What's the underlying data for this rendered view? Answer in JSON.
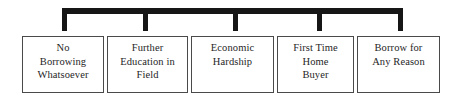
{
  "diagram": {
    "type": "bracket-hierarchy",
    "orientation": "horizontal",
    "connector": {
      "name": "top-bracket",
      "color": "#161616",
      "stem_count": 5
    },
    "options": [
      {
        "id": "no-borrowing",
        "label": "No\nBorrowing\nWhatsoever"
      },
      {
        "id": "further-education",
        "label": "Further\nEducation in\nField"
      },
      {
        "id": "economic-hardship",
        "label": "Economic\nHardship"
      },
      {
        "id": "first-time-buyer",
        "label": "First Time\nHome\nBuyer"
      },
      {
        "id": "borrow-any-reason",
        "label": "Borrow for\nAny Reason"
      }
    ]
  },
  "colors": {
    "bracket": "#161616",
    "box_border": "#4a4a4a",
    "text": "#262626",
    "background": "#ffffff"
  }
}
